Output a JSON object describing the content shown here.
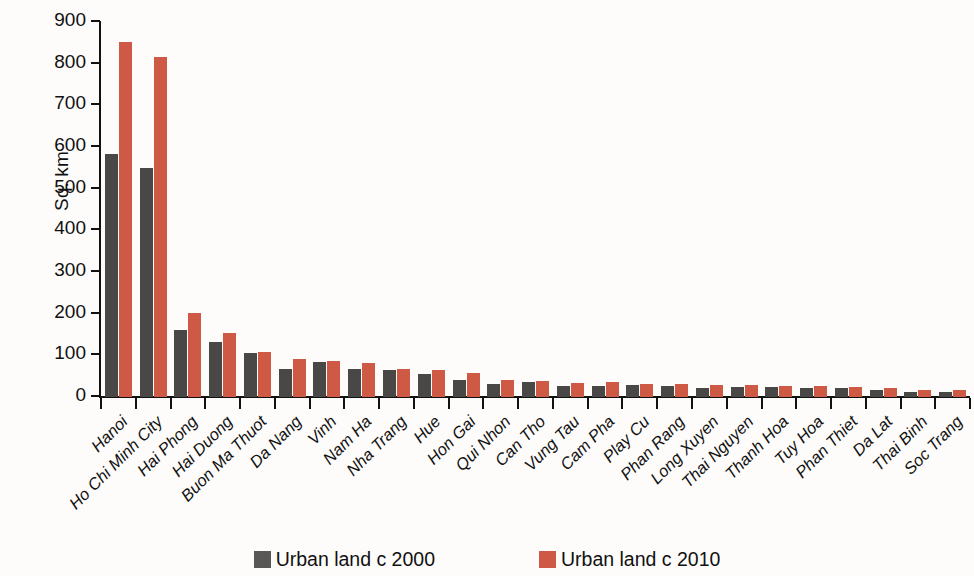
{
  "chart_data": {
    "type": "bar",
    "title": "",
    "xlabel": "",
    "ylabel": "Sq. km",
    "ylim": [
      0,
      900
    ],
    "yticks": [
      0,
      100,
      200,
      300,
      400,
      500,
      600,
      700,
      800,
      900
    ],
    "grid": false,
    "legend_position": "bottom",
    "colors": {
      "series_2000": "#4a4846",
      "series_2010": "#ce5a46",
      "background": "#fdfcfa",
      "axis": "#111111"
    },
    "categories": [
      "Hanoi",
      "Ho Chi Minh City",
      "Hai Phong",
      "Hai Duong",
      "Buon Ma Thuot",
      "Da Nang",
      "Vinh",
      "Nam Ha",
      "Nha Trang",
      "Hue",
      "Hon Gai",
      "Qui Nhon",
      "Can Tho",
      "Vung Tau",
      "Cam Pha",
      "Play Cu",
      "Phan Rang",
      "Long Xuyen",
      "Thai Nguyen",
      "Thanh Hoa",
      "Tuy Hoa",
      "Phan Thiet",
      "Da Lat",
      "Thai Binh",
      "Soc Trang"
    ],
    "series": [
      {
        "name": "Urban land c 2000",
        "color": "#4a4846",
        "values": [
          583,
          550,
          162,
          133,
          105,
          67,
          85,
          68,
          66,
          55,
          42,
          32,
          36,
          26,
          27,
          28,
          27,
          22,
          24,
          23,
          22,
          22,
          16,
          12,
          13
        ]
      },
      {
        "name": "Urban land c 2010",
        "color": "#ce5a46",
        "values": [
          851,
          815,
          202,
          153,
          108,
          92,
          87,
          82,
          68,
          64,
          57,
          41,
          39,
          34,
          35,
          32,
          31,
          28,
          29,
          27,
          26,
          25,
          21,
          18,
          16
        ]
      }
    ]
  },
  "legend": {
    "entries": [
      {
        "label": "Urban land c 2000",
        "swatch": "legend-swatch-2000"
      },
      {
        "label": "Urban land c 2010",
        "swatch": "legend-swatch-2010"
      }
    ]
  }
}
